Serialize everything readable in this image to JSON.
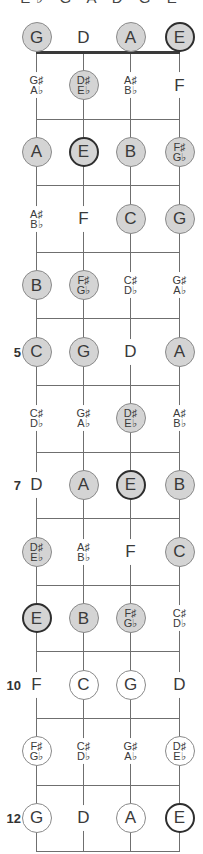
{
  "title": "E♭ G A D G E",
  "strings": [
    "G",
    "D",
    "A",
    "E"
  ],
  "fret_markers": [
    {
      "fret": 5,
      "label": "5"
    },
    {
      "fret": 7,
      "label": "7"
    },
    {
      "fret": 10,
      "label": "10"
    },
    {
      "fret": 12,
      "label": "12"
    }
  ],
  "fret_count": 12,
  "legend_styles": {
    "gray": "scale tone (filled gray)",
    "white": "scale tone (unfilled)",
    "root": "root note E (bold outline)",
    "none": "non-scale tone (no circle)"
  },
  "colors": {
    "fill_gray": "#d4d4d4",
    "outline": "#8a8a8a",
    "root_outline": "#2e2e2e",
    "line": "#6f6f6f"
  },
  "rows": [
    {
      "fret": 0,
      "notes": [
        {
          "label": [
            "G"
          ],
          "style": "gray"
        },
        {
          "label": [
            "D"
          ],
          "style": "none"
        },
        {
          "label": [
            "A"
          ],
          "style": "gray"
        },
        {
          "label": [
            "E"
          ],
          "style": "gray",
          "root": true
        }
      ]
    },
    {
      "fret": 1,
      "notes": [
        {
          "label": [
            "G♯",
            "A♭"
          ],
          "style": "none"
        },
        {
          "label": [
            "D♯",
            "E♭"
          ],
          "style": "gray"
        },
        {
          "label": [
            "A♯",
            "B♭"
          ],
          "style": "none"
        },
        {
          "label": [
            "F"
          ],
          "style": "none"
        }
      ]
    },
    {
      "fret": 2,
      "notes": [
        {
          "label": [
            "A"
          ],
          "style": "gray"
        },
        {
          "label": [
            "E"
          ],
          "style": "gray",
          "root": true
        },
        {
          "label": [
            "B"
          ],
          "style": "gray"
        },
        {
          "label": [
            "F♯",
            "G♭"
          ],
          "style": "gray"
        }
      ]
    },
    {
      "fret": 3,
      "notes": [
        {
          "label": [
            "A♯",
            "B♭"
          ],
          "style": "none"
        },
        {
          "label": [
            "F"
          ],
          "style": "none"
        },
        {
          "label": [
            "C"
          ],
          "style": "gray"
        },
        {
          "label": [
            "G"
          ],
          "style": "gray"
        }
      ]
    },
    {
      "fret": 4,
      "notes": [
        {
          "label": [
            "B"
          ],
          "style": "gray"
        },
        {
          "label": [
            "F♯",
            "G♭"
          ],
          "style": "gray"
        },
        {
          "label": [
            "C♯",
            "D♭"
          ],
          "style": "none"
        },
        {
          "label": [
            "G♯",
            "A♭"
          ],
          "style": "none"
        }
      ]
    },
    {
      "fret": 5,
      "notes": [
        {
          "label": [
            "C"
          ],
          "style": "gray"
        },
        {
          "label": [
            "G"
          ],
          "style": "gray"
        },
        {
          "label": [
            "D"
          ],
          "style": "none"
        },
        {
          "label": [
            "A"
          ],
          "style": "gray"
        }
      ]
    },
    {
      "fret": 6,
      "notes": [
        {
          "label": [
            "C♯",
            "D♭"
          ],
          "style": "none"
        },
        {
          "label": [
            "G♯",
            "A♭"
          ],
          "style": "none"
        },
        {
          "label": [
            "D♯",
            "E♭"
          ],
          "style": "gray"
        },
        {
          "label": [
            "A♯",
            "B♭"
          ],
          "style": "none"
        }
      ]
    },
    {
      "fret": 7,
      "notes": [
        {
          "label": [
            "D"
          ],
          "style": "none"
        },
        {
          "label": [
            "A"
          ],
          "style": "gray"
        },
        {
          "label": [
            "E"
          ],
          "style": "gray",
          "root": true
        },
        {
          "label": [
            "B"
          ],
          "style": "gray"
        }
      ]
    },
    {
      "fret": 8,
      "notes": [
        {
          "label": [
            "D♯",
            "E♭"
          ],
          "style": "gray"
        },
        {
          "label": [
            "A♯",
            "B♭"
          ],
          "style": "none"
        },
        {
          "label": [
            "F"
          ],
          "style": "none"
        },
        {
          "label": [
            "C"
          ],
          "style": "gray"
        }
      ]
    },
    {
      "fret": 9,
      "notes": [
        {
          "label": [
            "E"
          ],
          "style": "gray",
          "root": true
        },
        {
          "label": [
            "B"
          ],
          "style": "gray"
        },
        {
          "label": [
            "F♯",
            "G♭"
          ],
          "style": "gray"
        },
        {
          "label": [
            "C♯",
            "D♭"
          ],
          "style": "none"
        }
      ]
    },
    {
      "fret": 10,
      "notes": [
        {
          "label": [
            "F"
          ],
          "style": "none"
        },
        {
          "label": [
            "C"
          ],
          "style": "white"
        },
        {
          "label": [
            "G"
          ],
          "style": "white"
        },
        {
          "label": [
            "D"
          ],
          "style": "none"
        }
      ]
    },
    {
      "fret": 11,
      "notes": [
        {
          "label": [
            "F♯",
            "G♭"
          ],
          "style": "white"
        },
        {
          "label": [
            "C♯",
            "D♭"
          ],
          "style": "none"
        },
        {
          "label": [
            "G♯",
            "A♭"
          ],
          "style": "none"
        },
        {
          "label": [
            "D♯",
            "E♭"
          ],
          "style": "white"
        }
      ]
    },
    {
      "fret": 12,
      "notes": [
        {
          "label": [
            "G"
          ],
          "style": "white"
        },
        {
          "label": [
            "D"
          ],
          "style": "none"
        },
        {
          "label": [
            "A"
          ],
          "style": "white"
        },
        {
          "label": [
            "E"
          ],
          "style": "white",
          "root": true
        }
      ]
    }
  ]
}
